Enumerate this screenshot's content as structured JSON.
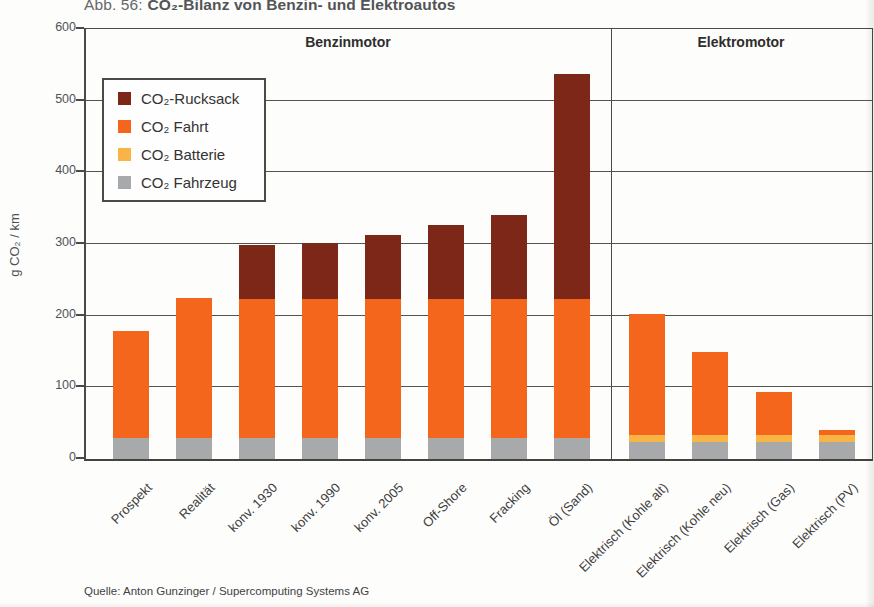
{
  "page": {
    "title_prefix": "Abb. 56:",
    "title_main": "CO₂-Bilanz von Benzin- und Elektroautos",
    "source": "Quelle: Anton Gunzinger / Supercomputing Systems AG"
  },
  "chart_data": {
    "type": "bar",
    "stacked": true,
    "ylabel": "g CO₂ / km",
    "ylim": [
      0,
      600
    ],
    "yticks": [
      0,
      100,
      200,
      300,
      400,
      500,
      600
    ],
    "grid": true,
    "legend_position": "upper-left-inside",
    "sections": [
      {
        "label": "Benzinmotor",
        "categories": [
          "Prospekt",
          "Realität",
          "konv. 1930",
          "konv. 1990",
          "konv. 2005",
          "Off-Shore",
          "Fracking",
          "Öl (Sand)"
        ]
      },
      {
        "label": "Elektromotor",
        "categories": [
          "Elektrisch (Kohle alt)",
          "Elektrisch (Kohle neu)",
          "Elektrisch (Gas)",
          "Elektrisch (PV)"
        ]
      }
    ],
    "series": [
      {
        "name": "CO₂ Fahrzeug",
        "color": "#a7a9aa",
        "values": [
          30,
          30,
          30,
          30,
          30,
          30,
          30,
          30,
          24,
          24,
          24,
          24
        ]
      },
      {
        "name": "CO₂ Batterie",
        "color": "#f8b444",
        "values": [
          0,
          0,
          0,
          0,
          0,
          0,
          0,
          0,
          9,
          9,
          9,
          9
        ]
      },
      {
        "name": "CO₂ Fahrt",
        "color": "#f4661b",
        "values": [
          148,
          194,
          193,
          193,
          193,
          193,
          193,
          193,
          169,
          116,
          60,
          8
        ]
      },
      {
        "name": "CO₂-Rucksack",
        "color": "#7c2717",
        "values": [
          0,
          0,
          75,
          78,
          89,
          103,
          117,
          314,
          0,
          0,
          0,
          0
        ]
      }
    ],
    "legend_order": [
      "CO₂-Rucksack",
      "CO₂ Fahrt",
      "CO₂ Batterie",
      "CO₂ Fahrzeug"
    ],
    "totals": [
      178,
      224,
      298,
      301,
      312,
      326,
      340,
      537,
      202,
      149,
      93,
      41
    ]
  }
}
